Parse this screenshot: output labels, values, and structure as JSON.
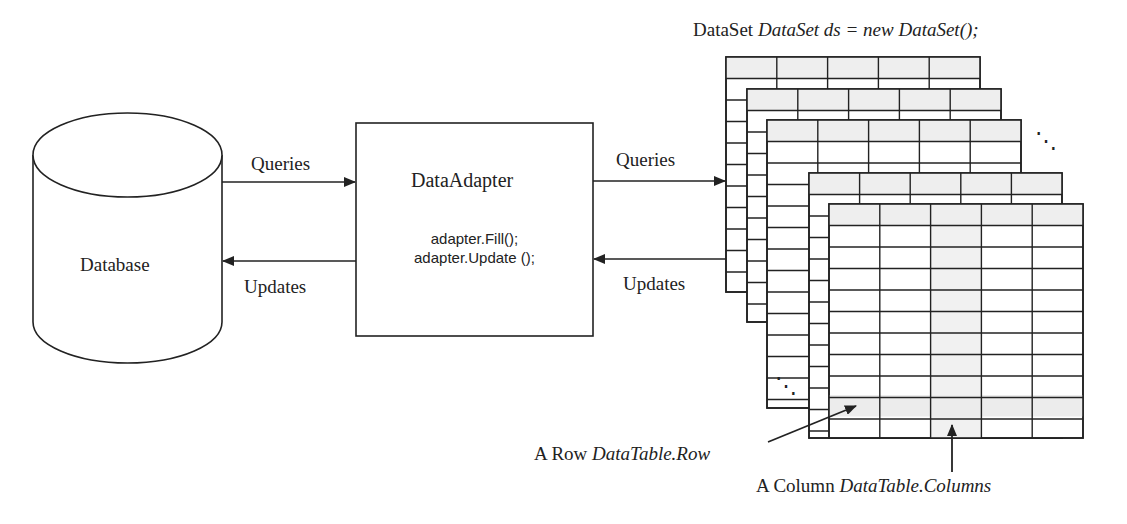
{
  "database": {
    "label": "Database"
  },
  "adapter": {
    "title": "DataAdapter",
    "methods": [
      "adapter.Fill();",
      "adapter.Update ();"
    ]
  },
  "left_arrows": {
    "queries": "Queries",
    "updates": "Updates"
  },
  "right_arrows": {
    "queries": "Queries",
    "updates": "Updates"
  },
  "dataset": {
    "prefix": "DataSet",
    "code": "DataSet ds  = new  DataSet();"
  },
  "annotations": {
    "row_prefix": "A Row",
    "row_code": "DataTable.Row",
    "column_prefix": "A Column",
    "column_code": "DataTable.Columns"
  },
  "ellipsis": "⋱",
  "colors": {
    "line": "#222222",
    "header_fill": "#eeeeee",
    "highlight_fill": "#f1f1f1",
    "background": "#ffffff"
  }
}
